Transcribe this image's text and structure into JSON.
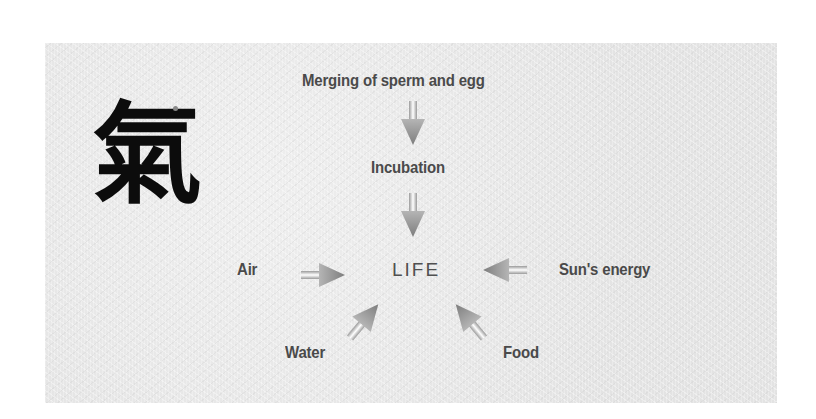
{
  "diagram": {
    "symbol": {
      "glyph": "氣",
      "meaning": "qi"
    },
    "center": {
      "label": "LIFE"
    },
    "nodes": [
      {
        "id": "merging",
        "label": "Merging of sperm and egg"
      },
      {
        "id": "incubation",
        "label": "Incubation"
      },
      {
        "id": "air",
        "label": "Air"
      },
      {
        "id": "sun",
        "label": "Sun's energy"
      },
      {
        "id": "water",
        "label": "Water"
      },
      {
        "id": "food",
        "label": "Food"
      }
    ],
    "edges": [
      {
        "from": "merging",
        "to": "incubation"
      },
      {
        "from": "incubation",
        "to": "LIFE"
      },
      {
        "from": "air",
        "to": "LIFE"
      },
      {
        "from": "sun",
        "to": "LIFE"
      },
      {
        "from": "water",
        "to": "LIFE"
      },
      {
        "from": "food",
        "to": "LIFE"
      }
    ],
    "colors": {
      "background": "#e9e9e9",
      "text": "#4a4a4a",
      "arrow": "#8a8a8a",
      "ink": "#0c0c0c"
    }
  }
}
